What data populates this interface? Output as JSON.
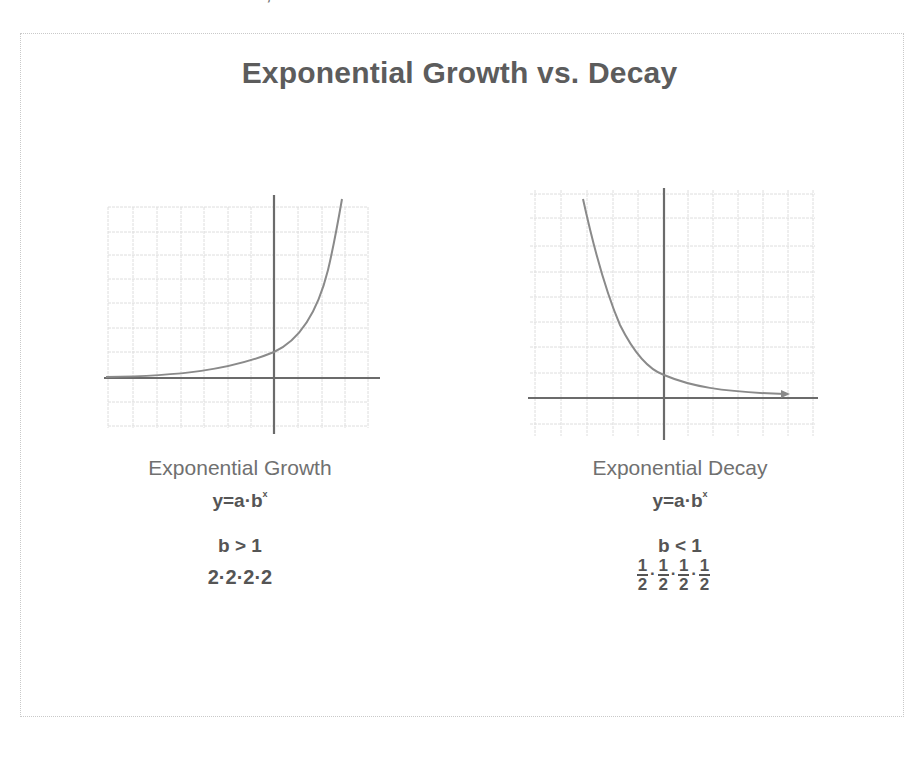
{
  "top_crop": {
    "left_fragment": "··· ··· ·· ··",
    "right_fragment": "/,e"
  },
  "title": "Exponential Growth vs. Decay",
  "colors": {
    "axis": "#6b6b6b",
    "grid": "#dcdcdc",
    "curve": "#8a8a8a",
    "text": "#5a5a5a",
    "border": "#c9c9c9"
  },
  "growth": {
    "label": "Exponential Growth",
    "formula_base": "y=a·b",
    "formula_exp": "x",
    "condition": "b > 1",
    "example": "2·2·2·2"
  },
  "decay": {
    "label": "Exponential Decay",
    "formula_base": "y=a·b",
    "formula_exp": "x",
    "condition": "b < 1",
    "example_fractions": [
      {
        "num": "1",
        "den": "2"
      },
      {
        "num": "1",
        "den": "2"
      },
      {
        "num": "1",
        "den": "2"
      },
      {
        "num": "1",
        "den": "2"
      }
    ],
    "example_separator": "·"
  }
}
